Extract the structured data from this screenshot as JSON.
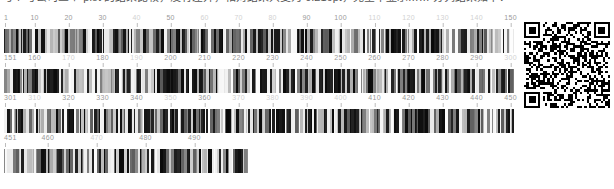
{
  "caption": {
    "text": "与 7 号公司三个 plot 的结果比较，没有差异，相对结果只变为 0.216pt，完全不显示…… 分列结果如下：",
    "clipped": true
  },
  "sequence_viewer": {
    "type": "barcode-sequence-ruler",
    "unit_width_px": 3.4,
    "rows": [
      {
        "start": 1,
        "end": 150,
        "width_px": 510,
        "ticks": [
          {
            "label": "1",
            "pos": 1,
            "faint": false
          },
          {
            "label": "10",
            "pos": 10,
            "faint": false
          },
          {
            "label": "20",
            "pos": 20,
            "faint": false
          },
          {
            "label": "30",
            "pos": 30,
            "faint": false
          },
          {
            "label": "40",
            "pos": 40,
            "faint": true
          },
          {
            "label": "50",
            "pos": 50,
            "faint": false
          },
          {
            "label": "60",
            "pos": 60,
            "faint": true
          },
          {
            "label": "70",
            "pos": 70,
            "faint": true
          },
          {
            "label": "80",
            "pos": 80,
            "faint": true
          },
          {
            "label": "90",
            "pos": 90,
            "faint": false
          },
          {
            "label": "100",
            "pos": 100,
            "faint": false
          },
          {
            "label": "110",
            "pos": 110,
            "faint": true
          },
          {
            "label": "120",
            "pos": 120,
            "faint": true
          },
          {
            "label": "130",
            "pos": 130,
            "faint": true
          },
          {
            "label": "140",
            "pos": 140,
            "faint": true
          },
          {
            "label": "150",
            "pos": 150,
            "faint": false
          }
        ]
      },
      {
        "start": 151,
        "end": 300,
        "width_px": 510,
        "ticks": [
          {
            "label": "151",
            "pos": 151,
            "faint": false
          },
          {
            "label": "160",
            "pos": 160,
            "faint": false
          },
          {
            "label": "170",
            "pos": 170,
            "faint": true
          },
          {
            "label": "180",
            "pos": 180,
            "faint": false
          },
          {
            "label": "190",
            "pos": 190,
            "faint": true
          },
          {
            "label": "200",
            "pos": 200,
            "faint": false
          },
          {
            "label": "210",
            "pos": 210,
            "faint": false
          },
          {
            "label": "220",
            "pos": 220,
            "faint": false
          },
          {
            "label": "230",
            "pos": 230,
            "faint": false
          },
          {
            "label": "240",
            "pos": 240,
            "faint": false
          },
          {
            "label": "250",
            "pos": 250,
            "faint": false
          },
          {
            "label": "260",
            "pos": 260,
            "faint": false
          },
          {
            "label": "270",
            "pos": 270,
            "faint": false
          },
          {
            "label": "280",
            "pos": 280,
            "faint": false
          },
          {
            "label": "290",
            "pos": 290,
            "faint": false
          },
          {
            "label": "300",
            "pos": 300,
            "faint": true
          }
        ]
      },
      {
        "start": 301,
        "end": 450,
        "width_px": 510,
        "ticks": [
          {
            "label": "301",
            "pos": 301,
            "faint": false
          },
          {
            "label": "310",
            "pos": 310,
            "faint": true
          },
          {
            "label": "320",
            "pos": 320,
            "faint": false
          },
          {
            "label": "330",
            "pos": 330,
            "faint": false
          },
          {
            "label": "340",
            "pos": 340,
            "faint": false
          },
          {
            "label": "350",
            "pos": 350,
            "faint": true
          },
          {
            "label": "360",
            "pos": 360,
            "faint": false
          },
          {
            "label": "370",
            "pos": 370,
            "faint": true
          },
          {
            "label": "380",
            "pos": 380,
            "faint": true
          },
          {
            "label": "390",
            "pos": 390,
            "faint": true
          },
          {
            "label": "400",
            "pos": 400,
            "faint": true
          },
          {
            "label": "410",
            "pos": 410,
            "faint": false
          },
          {
            "label": "420",
            "pos": 420,
            "faint": false
          },
          {
            "label": "430",
            "pos": 430,
            "faint": false
          },
          {
            "label": "440",
            "pos": 440,
            "faint": false
          },
          {
            "label": "450",
            "pos": 450,
            "faint": false
          }
        ]
      },
      {
        "start": 451,
        "end": 500,
        "width_px": 244,
        "ticks": [
          {
            "label": "451",
            "pos": 451,
            "faint": false
          },
          {
            "label": "460",
            "pos": 460,
            "faint": false
          },
          {
            "label": "470",
            "pos": 470,
            "faint": true
          },
          {
            "label": "480",
            "pos": 480,
            "faint": false
          },
          {
            "label": "490",
            "pos": 490,
            "faint": false
          }
        ]
      }
    ]
  },
  "qr_code": {
    "name": "qr-code",
    "size_px": 86,
    "modules": 37,
    "dark_color": "#000000",
    "light_color": "#ffffff"
  },
  "colors": {
    "label": "#9a9a9a",
    "label_faint": "#d2d2d2",
    "tick_mark": "#bdbdbd",
    "bar_dark": "#1a1a1a",
    "bar_light": "#e8e8e8",
    "background": "#ffffff"
  }
}
